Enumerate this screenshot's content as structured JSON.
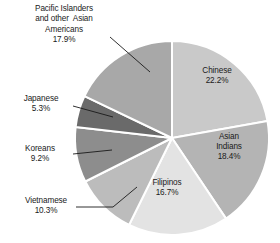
{
  "chart_data": {
    "type": "pie",
    "title": "",
    "subtitle": "",
    "xlabel": "",
    "ylabel": "",
    "legend_position": "none",
    "grid": false,
    "start_angle_deg": 0,
    "direction": "clockwise",
    "categories": [
      "Chinese",
      "Asian Indians",
      "Filipinos",
      "Vietnamese",
      "Koreans",
      "Japanese",
      "Pacific Islanders and other  Asian Americans"
    ],
    "values": [
      22.2,
      18.4,
      16.7,
      10.3,
      9.2,
      5.3,
      17.9
    ],
    "value_labels": [
      "22.2%",
      "18.4%",
      "16.7%",
      "10.3%",
      "9.2%",
      "5.3%",
      "17.9%"
    ],
    "unit": "%",
    "slices": [
      {
        "name": "Chinese",
        "value": 22.2,
        "value_label": "22.2%",
        "color": "#c9c9c9",
        "label_lines": [
          "Chinese",
          "22.2%"
        ],
        "label_placement": "inside"
      },
      {
        "name": "Asian Indians",
        "value": 18.4,
        "value_label": "18.4%",
        "color": "#b4b4b4",
        "label_lines": [
          "Asian",
          "Indians",
          "18.4%"
        ],
        "label_placement": "inside"
      },
      {
        "name": "Filipinos",
        "value": 16.7,
        "value_label": "16.7%",
        "color": "#e3e3e3",
        "label_lines": [
          "Filipinos",
          "16.7%"
        ],
        "label_placement": "inside"
      },
      {
        "name": "Vietnamese",
        "value": 10.3,
        "value_label": "10.3%",
        "color": "#bcbcbc",
        "label_lines": [
          "Vietnamese",
          "10.3%"
        ],
        "label_placement": "outside-left"
      },
      {
        "name": "Koreans",
        "value": 9.2,
        "value_label": "9.2%",
        "color": "#8d8d8d",
        "label_lines": [
          "Koreans",
          "9.2%"
        ],
        "label_placement": "outside-left"
      },
      {
        "name": "Japanese",
        "value": 5.3,
        "value_label": "5.3%",
        "color": "#6a6a6a",
        "label_lines": [
          "Japanese",
          "5.3%"
        ],
        "label_placement": "outside-left"
      },
      {
        "name": "Pacific Islanders and other  Asian Americans",
        "value": 17.9,
        "value_label": "17.9%",
        "color": "#a8a8a8",
        "label_lines": [
          "Pacific Islanders",
          "and other  Asian",
          "Americans",
          "17.9%"
        ],
        "label_placement": "outside-top-left"
      }
    ]
  },
  "labels": {
    "pacific": "Pacific Islanders\nand other  Asian\nAmericans\n17.9%",
    "japanese": "Japanese\n5.3%",
    "koreans": "Koreans\n9.2%",
    "vietnamese": "Vietnamese\n10.3%",
    "chinese": "Chinese\n22.2%",
    "asian_indians": "Asian\nIndians\n18.4%",
    "filipinos": "Filipinos\n16.7%"
  },
  "colors": {
    "background": "#ffffff",
    "separator": "#ffffff",
    "text": "#1a1a1a",
    "leader_line": "#1a1a1a"
  }
}
